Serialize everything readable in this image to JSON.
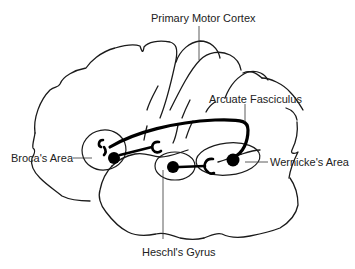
{
  "diagram": {
    "labels": {
      "primary_motor_cortex": "Primary Motor Cortex",
      "arcuate_fasciculus": "Arcuate Fasciculus",
      "brocas_area": "Broca's Area",
      "wernickes_area": "Wernicke's Area",
      "heschls_gyrus": "Heschl's Gyrus"
    },
    "colors": {
      "line": "#1a1a1a",
      "tract": "#000000",
      "text": "#222222",
      "background": "#ffffff"
    }
  }
}
